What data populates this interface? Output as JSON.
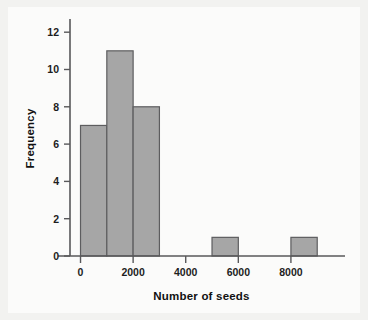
{
  "figure": {
    "kind": "histogram-figure",
    "background_color": "#f2f2f0",
    "panel_color": "#fbfbfa"
  },
  "ghost_text": {
    "lines": [
      "the values that lie near the center of the distribution",
      "and how spread out the observations are around it.",
      "A histogram shows the shape of the distribution of",
      "the data, which is often the first thing to check.",
      "",
      "Think About Conducting Research",
      "",
      "the number of seeds for each of the plants in the",
      "sample. The table below gives the results.",
      "",
      "Some species produce far more seeds than others,",
      "so the distribution is strongly right-skewed.",
      "A few very large values pull the mean upward.",
      "",
      "Try It"
    ]
  },
  "chart_data": {
    "type": "bar",
    "title": "",
    "xlabel": "Number of seeds",
    "ylabel": "Frequency",
    "xlim": [
      -400,
      9600
    ],
    "ylim": [
      0,
      12.6
    ],
    "xticks": [
      0,
      2000,
      4000,
      6000,
      8000
    ],
    "xtick_labels": [
      "0",
      "2000",
      "4000",
      "6000",
      "8000"
    ],
    "yticks": [
      0,
      2,
      4,
      6,
      8,
      10,
      12
    ],
    "ytick_labels": [
      "0",
      "2",
      "4",
      "6",
      "8",
      "10",
      "12"
    ],
    "grid": false,
    "legend": null,
    "bin_width": 1000,
    "bars": [
      {
        "bin_start": 0,
        "bin_end": 1000,
        "value": 7
      },
      {
        "bin_start": 1000,
        "bin_end": 2000,
        "value": 11
      },
      {
        "bin_start": 2000,
        "bin_end": 3000,
        "value": 8
      },
      {
        "bin_start": 5000,
        "bin_end": 6000,
        "value": 1
      },
      {
        "bin_start": 8000,
        "bin_end": 9000,
        "value": 1
      }
    ],
    "bar_fill_color": "#a6a6a6",
    "bar_edge_color": "#5d5d5f",
    "axis_color": "#58585a"
  }
}
